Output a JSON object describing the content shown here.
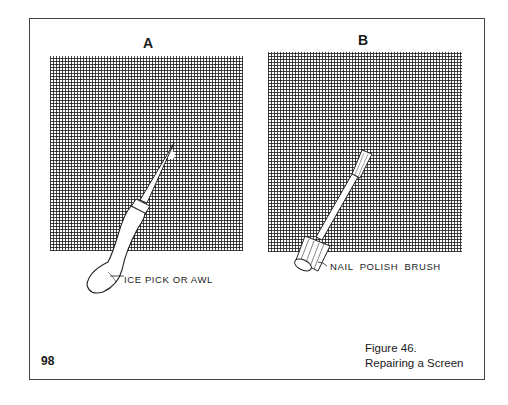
{
  "panels": [
    {
      "label": "A",
      "caption": "ICE PICK OR AWL"
    },
    {
      "label": "B",
      "caption": "NAIL  POLISH  BRUSH"
    }
  ],
  "page_number": "98",
  "figure": {
    "number": "Figure 46.",
    "title": "Repairing a Screen"
  }
}
